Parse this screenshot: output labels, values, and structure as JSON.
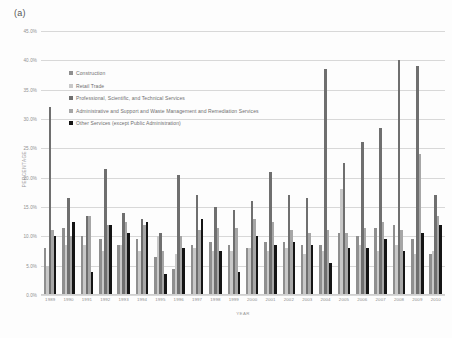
{
  "panel_label": "(a)",
  "chart_data": {
    "type": "bar",
    "title": "",
    "xlabel": "YEAR",
    "ylabel": "PERCENTAGE",
    "ylim": [
      0,
      45
    ],
    "ytick_labels": [
      "45.0%",
      "40.0%",
      "35.0%",
      "30.0%",
      "25.0%",
      "20.0%",
      "15.0%",
      "10.0%",
      "5.0%",
      "0.0%"
    ],
    "ytick_values": [
      45,
      40,
      35,
      30,
      25,
      20,
      15,
      10,
      5,
      0
    ],
    "grid": true,
    "legend_position": "inside-upper-left",
    "categories": [
      "1989",
      "1990",
      "1991",
      "1992",
      "1993",
      "1994",
      "1995",
      "1996",
      "1997",
      "1998",
      "1999",
      "2000",
      "2001",
      "2002",
      "2003",
      "2004",
      "2005",
      "2006",
      "2007",
      "2008",
      "2009",
      "2010"
    ],
    "series": [
      {
        "name": "Construction",
        "color": "#8f8f8f",
        "values": [
          8.0,
          11.5,
          10.0,
          9.5,
          8.5,
          9.5,
          6.5,
          4.5,
          8.5,
          9.0,
          8.5,
          8.0,
          9.0,
          9.0,
          8.5,
          8.5,
          10.5,
          10.0,
          11.5,
          12.0,
          9.5,
          7.0
        ]
      },
      {
        "name": "Retail Trade",
        "color": "#c8c8c8",
        "values": [
          5.0,
          8.5,
          8.5,
          7.5,
          8.5,
          7.5,
          10.0,
          7.0,
          8.0,
          7.5,
          7.5,
          8.0,
          7.5,
          8.0,
          7.0,
          7.5,
          18.0,
          8.5,
          7.5,
          8.5,
          7.0,
          7.5
        ]
      },
      {
        "name": "Professional, Scientific, and Technical Services",
        "color": "#6f6f6f",
        "values": [
          32.0,
          16.5,
          13.5,
          21.5,
          14.0,
          13.0,
          10.5,
          20.5,
          17.0,
          15.0,
          14.5,
          16.0,
          21.0,
          17.0,
          16.5,
          38.5,
          22.5,
          26.0,
          28.5,
          40.0,
          39.0,
          17.0
        ]
      },
      {
        "name": "Administrative and Support and Waste Management and Remediation Services",
        "color": "#a6a6a6",
        "values": [
          11.0,
          10.0,
          13.5,
          12.0,
          12.5,
          12.0,
          7.5,
          10.0,
          11.0,
          11.5,
          11.5,
          13.0,
          12.5,
          11.0,
          10.5,
          11.0,
          10.5,
          11.5,
          12.5,
          11.0,
          24.0,
          13.5
        ]
      },
      {
        "name": "Other Services (except Public Administration)",
        "color": "#141414",
        "values": [
          10.0,
          12.5,
          4.0,
          12.0,
          10.5,
          12.5,
          3.5,
          8.0,
          13.0,
          7.5,
          4.0,
          10.0,
          8.5,
          9.0,
          8.5,
          5.5,
          8.0,
          8.0,
          9.5,
          7.5,
          10.5,
          12.0
        ]
      }
    ]
  }
}
